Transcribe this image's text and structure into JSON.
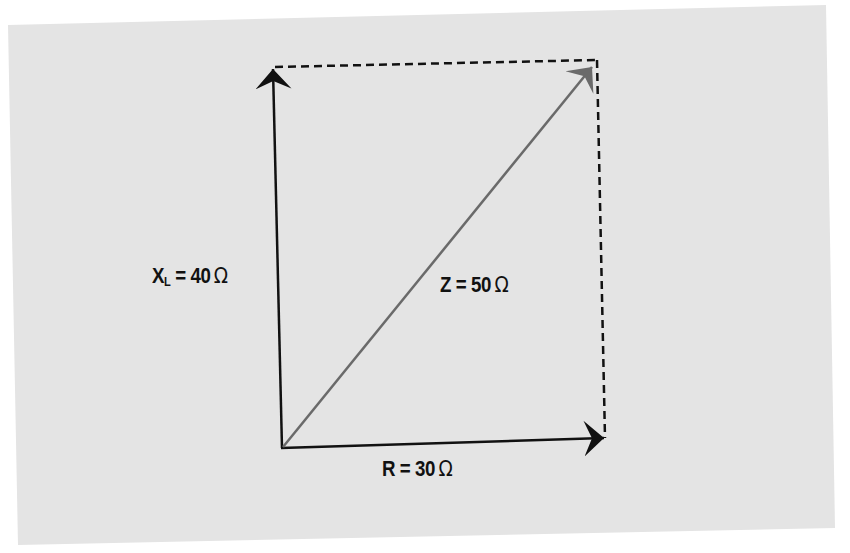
{
  "diagram": {
    "colors": {
      "page_background": "#ffffff",
      "panel_background": "#e4e4e4",
      "vector_black": "#111111",
      "vector_impedance": "#6a6a6a",
      "dashed_line": "#111111",
      "label_text": "#111111"
    },
    "vectors": [
      {
        "id": "reactance",
        "symbol": "X",
        "subscript": "L",
        "equals": "=",
        "value": "40",
        "unit": "Ω",
        "direction": "up",
        "from": [
          282,
          448
        ],
        "to": [
          273,
          67
        ]
      },
      {
        "id": "resistance",
        "symbol": "R",
        "equals": "=",
        "value": "30",
        "unit": "Ω",
        "direction": "right",
        "from": [
          282,
          448
        ],
        "to": [
          605,
          438
        ]
      },
      {
        "id": "impedance",
        "symbol": "Z",
        "equals": "=",
        "value": "50",
        "unit": "Ω",
        "direction": "diagonal",
        "from": [
          282,
          448
        ],
        "to": [
          593,
          66
        ]
      }
    ],
    "labels": {
      "reactance": {
        "symbol": "X",
        "subscript": "L",
        "rest": " = 40",
        "unit": "Ω"
      },
      "impedance": {
        "symbol": "Z",
        "rest": " = 50",
        "unit": "Ω"
      },
      "resistance": {
        "symbol": "R",
        "rest": " = 30",
        "unit": "Ω"
      }
    },
    "dashed_guides": [
      {
        "id": "top-guide",
        "from": [
          273,
          67
        ],
        "to": [
          597,
          60
        ]
      },
      {
        "id": "right-guide",
        "from": [
          597,
          60
        ],
        "to": [
          605,
          438
        ]
      }
    ]
  }
}
